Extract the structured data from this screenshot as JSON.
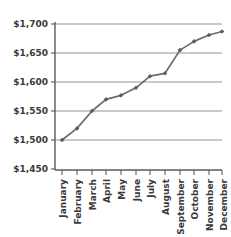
{
  "chart_data": {
    "type": "line",
    "title": "",
    "subtitle": "",
    "xlabel": "",
    "ylabel": "",
    "categories": [
      "January",
      "February",
      "March",
      "April",
      "May",
      "June",
      "July",
      "August",
      "September",
      "October",
      "November",
      "December"
    ],
    "values": [
      1500,
      1520,
      1550,
      1570,
      1577,
      1590,
      1610,
      1615,
      1655,
      1670,
      1681,
      1687
    ],
    "series": [
      {
        "name": "",
        "values": [
          1500,
          1520,
          1550,
          1570,
          1577,
          1590,
          1610,
          1615,
          1655,
          1670,
          1681,
          1687
        ]
      }
    ],
    "ylim": [
      1450,
      1700
    ],
    "ytick_values": [
      1450,
      1500,
      1550,
      1600,
      1650,
      1700
    ],
    "ytick_labels": [
      "$1,450",
      "$1,500",
      "$1,550",
      "$1,600",
      "$1,650",
      "$1,700"
    ],
    "grid": true,
    "grid_axis": "y",
    "legend": false,
    "legend_position": "none",
    "marker": "diamond",
    "annotations": []
  },
  "style": {
    "line_color": "#6b6b6b",
    "marker_color": "#5d5d5d",
    "grid_color": "#7a7a7a",
    "axis_color": "#5a5a5a",
    "text_color": "#3a3a3a",
    "background": "#ffffff"
  }
}
